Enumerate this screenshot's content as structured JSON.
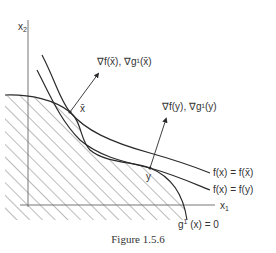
{
  "figure": {
    "caption": "Figure 1.5.6",
    "axes": {
      "x1_label": "x",
      "x1_sub": "1",
      "x2_label": "x",
      "x2_sub": "2"
    },
    "points": {
      "x_bar": "x̄",
      "y": "y"
    },
    "gradient_labels": {
      "at_x_bar": "∇f(x̄), ∇g¹(x̄)",
      "at_y": "∇f(y), ∇g¹(y)"
    },
    "contour_labels": {
      "upper": "f(x) = f(x̄)",
      "lower": "f(x) = f(y)"
    },
    "constraint_label": {
      "g": "g",
      "sup": "1",
      "rest": " (x) = 0"
    },
    "colors": {
      "ink": "#2a2a2a",
      "hatch": "#555555",
      "axis": "#777777"
    }
  }
}
